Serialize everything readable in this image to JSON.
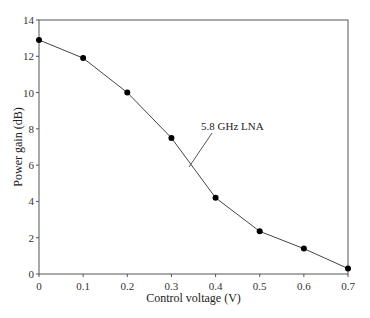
{
  "chart_data": {
    "type": "line",
    "title": "",
    "xlabel": "Control voltage (V)",
    "ylabel": "Power gain (dB)",
    "xlim": [
      0,
      0.7
    ],
    "ylim": [
      0,
      14
    ],
    "xticks": [
      "0",
      "0.1",
      "0.2",
      "0.3",
      "0.4",
      "0.5",
      "0.6",
      "0.7"
    ],
    "yticks": [
      "0",
      "2",
      "4",
      "6",
      "8",
      "10",
      "12",
      "14"
    ],
    "grid": false,
    "legend": null,
    "series": [
      {
        "name": "5.8 GHz LNA",
        "marker": "filled-circle",
        "color": "#000000",
        "x": [
          0,
          0.1,
          0.2,
          0.3,
          0.4,
          0.5,
          0.6,
          0.7
        ],
        "y": [
          12.9,
          11.9,
          10.0,
          7.5,
          4.2,
          2.35,
          1.4,
          0.3
        ]
      }
    ],
    "annotations": [
      {
        "text": "5.8 GHz LNA",
        "pointer_to": {
          "x": 0.34,
          "y": 5.9
        }
      }
    ]
  }
}
